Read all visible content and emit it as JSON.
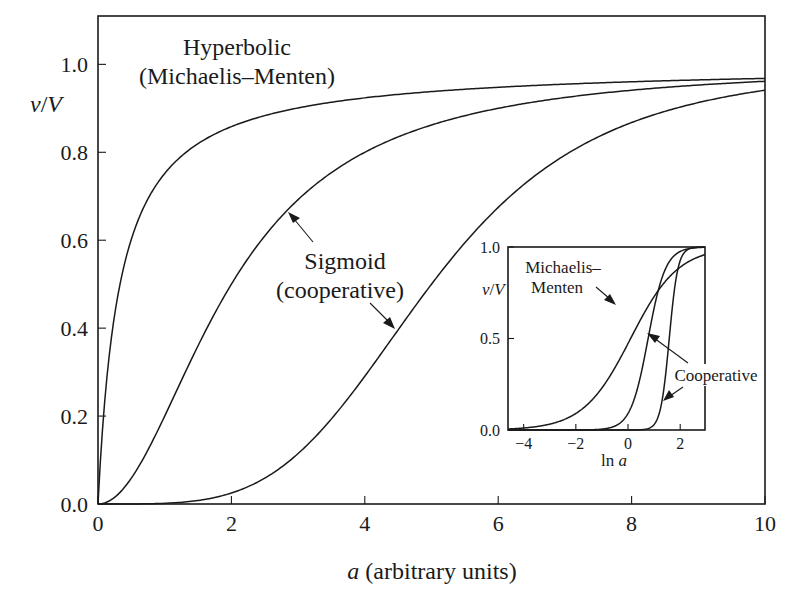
{
  "chart_data": [
    {
      "id": "main",
      "type": "line",
      "title": "",
      "xlabel_var": "a",
      "xlabel_rest": " (arbitrary units)",
      "ylabel_v": "v",
      "ylabel_slash": "/",
      "ylabel_V": "V",
      "xlim": [
        0,
        10
      ],
      "ylim": [
        0,
        1.11
      ],
      "grid": false,
      "x_ticks": [
        0,
        2,
        4,
        6,
        8,
        10
      ],
      "x_tick_labels": [
        "0",
        "2",
        "4",
        "6",
        "8",
        "10"
      ],
      "y_ticks": [
        0,
        0.2,
        0.4,
        0.6,
        0.8,
        1.0
      ],
      "y_tick_labels": [
        "0.0",
        "0.2",
        "0.4",
        "0.6",
        "0.8",
        "1.0"
      ],
      "series": [
        {
          "name": "Hyperbolic (Michaelis–Menten)",
          "model": "hill",
          "n": 1,
          "K": 0.33,
          "x": [
            0,
            0.25,
            0.5,
            1,
            1.5,
            2,
            3,
            4,
            6,
            8,
            10
          ],
          "values": [
            0,
            0.43,
            0.6,
            0.75,
            0.82,
            0.86,
            0.9,
            0.92,
            0.95,
            0.96,
            0.97
          ]
        },
        {
          "name": "Sigmoid (cooperative) n=2",
          "model": "hill",
          "n": 2,
          "K": 2,
          "x": [
            0,
            0.5,
            1,
            1.5,
            2,
            3,
            4,
            6,
            8,
            10
          ],
          "values": [
            0,
            0.06,
            0.2,
            0.36,
            0.5,
            0.69,
            0.8,
            0.9,
            0.94,
            0.96
          ]
        },
        {
          "name": "Sigmoid (cooperative) n=4",
          "model": "hill",
          "n": 4,
          "K": 5,
          "x": [
            0,
            1,
            2,
            3,
            4,
            5,
            6,
            7,
            8,
            9,
            10
          ],
          "values": [
            0,
            0.002,
            0.025,
            0.11,
            0.29,
            0.5,
            0.67,
            0.79,
            0.87,
            0.91,
            0.94
          ]
        }
      ],
      "annotations": [
        {
          "text_line1": "Hyperbolic",
          "text_line2": "(Michaelis–Menten)"
        },
        {
          "text_line1": "Sigmoid",
          "text_line2": "(cooperative)"
        }
      ]
    },
    {
      "id": "inset",
      "type": "line",
      "xlabel_pre": "ln ",
      "xlabel_var": "a",
      "ylabel_v": "v",
      "ylabel_slash": "/",
      "ylabel_V": "V",
      "xlim": [
        -4.6,
        2.95
      ],
      "ylim": [
        0,
        1.0
      ],
      "grid": false,
      "x_ticks": [
        -4,
        -2,
        0,
        2
      ],
      "x_tick_labels": [
        "−4",
        "−2",
        "0",
        "2"
      ],
      "y_ticks": [
        0,
        0.5,
        1.0
      ],
      "y_tick_labels": [
        "0.0",
        "0.5",
        "1.0"
      ],
      "series": [
        {
          "name": "Michaelis–Menten",
          "model": "logistic",
          "n": 1.1,
          "x0": 0.1,
          "x": [
            -4.6,
            -4,
            -2,
            0,
            1,
            2,
            2.95
          ],
          "values": [
            0.01,
            0.02,
            0.09,
            0.47,
            0.73,
            0.89,
            0.96
          ]
        },
        {
          "name": "Cooperative (moderate)",
          "model": "logistic",
          "n": 3,
          "x0": 0.77,
          "x": [
            -2,
            -1,
            0,
            0.77,
            1.5,
            2,
            2.95
          ],
          "values": [
            0.0,
            0.005,
            0.09,
            0.5,
            0.9,
            0.98,
            1.0
          ]
        },
        {
          "name": "Cooperative (strong)",
          "model": "logistic",
          "n": 6,
          "x0": 1.58,
          "x": [
            0.5,
            1,
            1.58,
            2,
            2.5,
            2.95
          ],
          "values": [
            0.0,
            0.03,
            0.5,
            0.93,
            1.0,
            1.0
          ]
        }
      ],
      "annotations": [
        {
          "text_line1": "Michaelis–",
          "text_line2": "Menten"
        },
        {
          "text_line1": "Cooperative"
        }
      ]
    }
  ]
}
